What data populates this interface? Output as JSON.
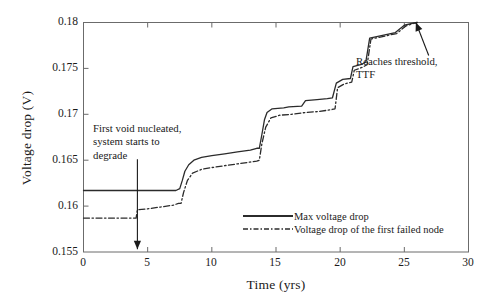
{
  "chart_data": {
    "type": "line",
    "title": "",
    "xlabel": "Time (yrs)",
    "ylabel": "Voltage drop (V)",
    "xlim": [
      0,
      30
    ],
    "ylim": [
      0.155,
      0.18
    ],
    "xticks": [
      "0",
      "5",
      "10",
      "15",
      "20",
      "25",
      "30"
    ],
    "xtick_values": [
      0,
      5,
      10,
      15,
      20,
      25,
      30
    ],
    "yticks": [
      "0.155",
      "0.16",
      "0.165",
      "0.17",
      "0.175",
      "0.18"
    ],
    "ytick_values": [
      0.155,
      0.16,
      0.165,
      0.17,
      0.175,
      0.18
    ],
    "grid": false,
    "legend_position": "inside-lower-center",
    "series": [
      {
        "name": "Max voltage drop",
        "style": "solid",
        "color": "#2b2b2b",
        "points": [
          [
            0.0,
            0.1617
          ],
          [
            4.1,
            0.1617
          ],
          [
            7.2,
            0.1617
          ],
          [
            7.5,
            0.1619
          ],
          [
            7.7,
            0.1628
          ],
          [
            7.9,
            0.1638
          ],
          [
            8.2,
            0.1645
          ],
          [
            8.6,
            0.165
          ],
          [
            9.2,
            0.1653
          ],
          [
            10.0,
            0.1655
          ],
          [
            11.0,
            0.1657
          ],
          [
            12.0,
            0.1659
          ],
          [
            13.0,
            0.1661
          ],
          [
            13.5,
            0.1663
          ],
          [
            13.7,
            0.1663
          ],
          [
            13.9,
            0.1678
          ],
          [
            14.1,
            0.1694
          ],
          [
            14.3,
            0.1702
          ],
          [
            14.7,
            0.1706
          ],
          [
            15.6,
            0.1707
          ],
          [
            16.0,
            0.1708
          ],
          [
            17.0,
            0.1709
          ],
          [
            17.3,
            0.1715
          ],
          [
            18.2,
            0.1716
          ],
          [
            19.0,
            0.1717
          ],
          [
            19.4,
            0.1718
          ],
          [
            19.7,
            0.1734
          ],
          [
            20.2,
            0.1738
          ],
          [
            20.8,
            0.1739
          ],
          [
            21.0,
            0.1752
          ],
          [
            21.6,
            0.1754
          ],
          [
            22.0,
            0.1757
          ],
          [
            22.3,
            0.1783
          ],
          [
            23.3,
            0.1786
          ],
          [
            24.3,
            0.1789
          ],
          [
            25.0,
            0.1797
          ],
          [
            25.6,
            0.1799
          ],
          [
            26.0,
            0.18
          ]
        ]
      },
      {
        "name": "Voltage drop of the first failed node",
        "style": "dashdot",
        "color": "#2b2b2b",
        "points": [
          [
            0.0,
            0.1587
          ],
          [
            4.1,
            0.1587
          ],
          [
            4.2,
            0.1596
          ],
          [
            5.0,
            0.1597
          ],
          [
            6.0,
            0.1599
          ],
          [
            7.0,
            0.1601
          ],
          [
            7.4,
            0.1603
          ],
          [
            7.6,
            0.1603
          ],
          [
            7.8,
            0.1615
          ],
          [
            8.1,
            0.1628
          ],
          [
            8.5,
            0.1636
          ],
          [
            9.2,
            0.164
          ],
          [
            10.0,
            0.1642
          ],
          [
            11.0,
            0.1644
          ],
          [
            12.0,
            0.1646
          ],
          [
            13.0,
            0.1648
          ],
          [
            13.5,
            0.1649
          ],
          [
            13.7,
            0.165
          ],
          [
            13.9,
            0.1668
          ],
          [
            14.2,
            0.1686
          ],
          [
            14.6,
            0.1696
          ],
          [
            15.3,
            0.1699
          ],
          [
            16.2,
            0.17
          ],
          [
            17.3,
            0.1702
          ],
          [
            18.3,
            0.1703
          ],
          [
            19.3,
            0.1705
          ],
          [
            19.6,
            0.1706
          ],
          [
            19.8,
            0.1729
          ],
          [
            20.3,
            0.1733
          ],
          [
            20.9,
            0.1735
          ],
          [
            21.1,
            0.1748
          ],
          [
            21.7,
            0.1751
          ],
          [
            22.1,
            0.1754
          ],
          [
            22.4,
            0.1782
          ],
          [
            23.4,
            0.1785
          ],
          [
            24.4,
            0.1788
          ],
          [
            25.1,
            0.1796
          ],
          [
            25.7,
            0.1799
          ],
          [
            26.0,
            0.18
          ]
        ]
      }
    ],
    "annotations": [
      {
        "id": "first-void",
        "lines": [
          "First void nucleated,",
          "system starts to",
          "degrade"
        ],
        "arrow": {
          "from_x": 4.2,
          "from_y": 0.1651,
          "to_x": 4.2,
          "to_y": 0.1553
        }
      },
      {
        "id": "reaches-threshold",
        "lines": [
          "Reaches threshold,",
          "TTF"
        ],
        "arrow": {
          "from_x": 26.9,
          "from_y": 0.1764,
          "to_x": 25.9,
          "to_y": 0.18
        }
      }
    ]
  }
}
